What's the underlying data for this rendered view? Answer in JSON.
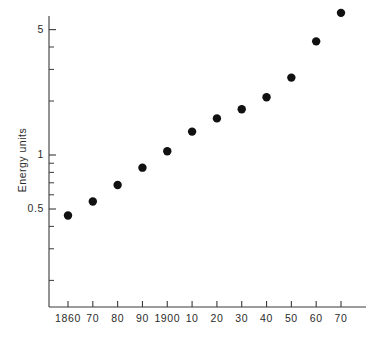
{
  "chart_data": {
    "type": "scatter",
    "title": "",
    "xlabel": "",
    "ylabel": "Energy units",
    "yscale": "log",
    "xscale": "linear",
    "grid": false,
    "legend": null,
    "xlim": [
      1855,
      1975
    ],
    "ylim": [
      0.14,
      9.0
    ],
    "x_tick_labels": [
      "1860",
      "70",
      "80",
      "90",
      "1900",
      "10",
      "20",
      "30",
      "40",
      "50",
      "60",
      "70"
    ],
    "x_tick_values": [
      1860,
      1870,
      1880,
      1890,
      1900,
      1910,
      1920,
      1930,
      1940,
      1950,
      1960,
      1970
    ],
    "y_tick_labels": [
      "5",
      "1",
      "0.5"
    ],
    "y_tick_values": [
      5,
      1,
      0.5
    ],
    "y_minor_ticks": [
      0.2,
      0.3,
      0.4,
      0.6,
      0.7,
      0.8,
      0.9,
      2,
      3,
      4,
      6,
      7,
      8
    ],
    "categories": [
      "1860",
      "1870",
      "1880",
      "1890",
      "1900",
      "1910",
      "1920",
      "1930",
      "1940",
      "1950",
      "1960",
      "1970"
    ],
    "values": [
      0.46,
      0.55,
      0.68,
      0.85,
      1.05,
      1.35,
      1.6,
      1.8,
      2.1,
      2.7,
      4.3,
      6.2
    ],
    "series": [
      {
        "name": "Energy units",
        "points": [
          {
            "x": 1860,
            "y": 0.46
          },
          {
            "x": 1870,
            "y": 0.55
          },
          {
            "x": 1880,
            "y": 0.68
          },
          {
            "x": 1890,
            "y": 0.85
          },
          {
            "x": 1900,
            "y": 1.05
          },
          {
            "x": 1910,
            "y": 1.35
          },
          {
            "x": 1920,
            "y": 1.6
          },
          {
            "x": 1930,
            "y": 1.8
          },
          {
            "x": 1940,
            "y": 2.1
          },
          {
            "x": 1950,
            "y": 2.7
          },
          {
            "x": 1960,
            "y": 4.3
          },
          {
            "x": 1970,
            "y": 6.2
          }
        ]
      }
    ],
    "marker": {
      "shape": "circle",
      "color": "#111111",
      "size": 4.2
    }
  },
  "colors": {
    "background": "#ffffff",
    "axis": "#3a3a3a",
    "text": "#2b2b2b",
    "marker": "#111111"
  }
}
